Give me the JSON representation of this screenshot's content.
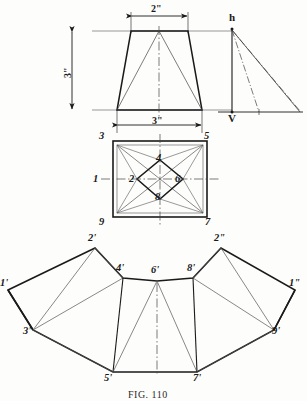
{
  "figure": {
    "caption": "FIG. 110",
    "background_color": "#fdfdfc",
    "line_color": "#1a1a1a"
  },
  "dimensions": {
    "top_width": "2\"",
    "bottom_width": "3\"",
    "height": "3\""
  },
  "front_view": {
    "name": "front-elevation-trapezoid",
    "top_left_x": 131,
    "top_right_x": 188,
    "top_y": 31,
    "bottom_left_x": 117,
    "bottom_right_x": 202,
    "bottom_y": 110
  },
  "true_length_diagram": {
    "apex_label": "h",
    "base_label": "V",
    "apex_x": 232,
    "apex_y": 28,
    "base_x": 232,
    "base_y": 112,
    "base_end_x": 300
  },
  "plan_view": {
    "name": "plan-view-square",
    "left": 113,
    "right": 207,
    "top": 141,
    "bottom": 217,
    "corner_labels": [
      {
        "text": "3",
        "x": 99,
        "y": 131
      },
      {
        "text": "5",
        "x": 204,
        "y": 131
      },
      {
        "text": "9",
        "x": 99,
        "y": 218
      },
      {
        "text": "7",
        "x": 204,
        "y": 218
      }
    ],
    "inner_labels": [
      {
        "text": "4",
        "x": 156,
        "y": 157
      },
      {
        "text": "2",
        "x": 131,
        "y": 176
      },
      {
        "text": "6",
        "x": 176,
        "y": 176
      },
      {
        "text": "8",
        "x": 156,
        "y": 196
      },
      {
        "text": "1",
        "x": 93,
        "y": 176
      }
    ]
  },
  "development": {
    "name": "pattern-development",
    "vertices": [
      {
        "id": "1p",
        "label": "1'",
        "x": 8,
        "y": 290,
        "lx": -1,
        "ly": 278
      },
      {
        "id": "2p",
        "label": "2'",
        "x": 95,
        "y": 248,
        "lx": 87,
        "ly": 234
      },
      {
        "id": "3p",
        "label": "3'",
        "x": 33,
        "y": 330,
        "lx": 22,
        "ly": 327
      },
      {
        "id": "4p",
        "label": "4'",
        "x": 123,
        "y": 278,
        "lx": 115,
        "ly": 264
      },
      {
        "id": "5p",
        "label": "5'",
        "x": 113,
        "y": 372,
        "lx": 103,
        "ly": 374
      },
      {
        "id": "6p",
        "label": "6'",
        "x": 157,
        "y": 281,
        "lx": 150,
        "ly": 266
      },
      {
        "id": "7p",
        "label": "7'",
        "x": 197,
        "y": 372,
        "lx": 193,
        "ly": 374
      },
      {
        "id": "8p",
        "label": "8'",
        "x": 193,
        "y": 278,
        "lx": 187,
        "ly": 264
      },
      {
        "id": "9p",
        "label": "9'",
        "x": 274,
        "y": 330,
        "lx": 272,
        "ly": 327
      },
      {
        "id": "2pp",
        "label": "2\"",
        "x": 221,
        "y": 248,
        "lx": 214,
        "ly": 234
      },
      {
        "id": "1pp",
        "label": "1\"",
        "x": 295,
        "y": 290,
        "lx": 288,
        "ly": 278
      }
    ]
  }
}
